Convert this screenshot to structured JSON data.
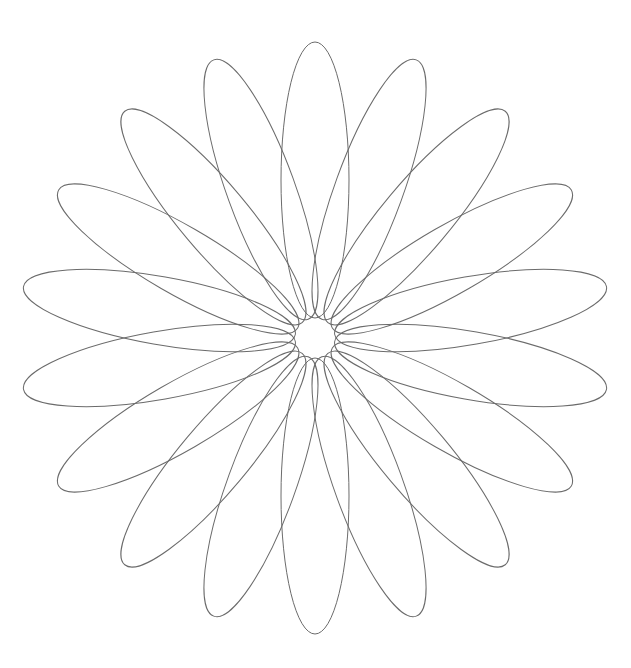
{
  "figure": {
    "petal_count": 18,
    "center": [
      315,
      338
    ],
    "inner_radius": 20,
    "outer_radius": 296,
    "petal_half_width": 34,
    "start_angle_deg": 90,
    "stroke_color": "#6b6b6b",
    "background_color": "#ffffff"
  }
}
